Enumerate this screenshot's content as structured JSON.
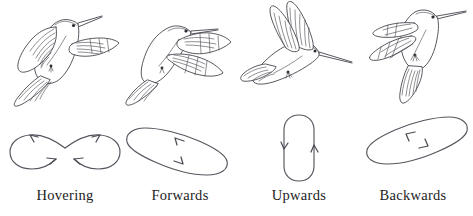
{
  "figure": {
    "background_color": "#ffffff",
    "line_color": "#3b3b44",
    "path_color": "#55555e",
    "label_color": "#1c1c1c"
  },
  "panels": [
    {
      "id": "hovering",
      "label": "Hovering",
      "bird_name": "hummingbird-hovering",
      "bird_pose": "body angled up-left, wings swept back, tail fanned down-left, bill pointing up-right",
      "path_name": "figure-eight-path",
      "path_shape": "figure-eight",
      "path_description": "Horizontal figure-eight wingtip stroke with two crossing lobes",
      "arrows": [
        {
          "name": "arrow-upper-left",
          "direction": "up-left"
        },
        {
          "name": "arrow-lower-left",
          "direction": "right"
        },
        {
          "name": "arrow-upper-right",
          "direction": "up-right"
        },
        {
          "name": "arrow-lower-right",
          "direction": "left"
        }
      ]
    },
    {
      "id": "forwards",
      "label": "Forwards",
      "bird_name": "hummingbird-forwards",
      "bird_pose": "body horizontal, wings extended outward to the right, tail fanned left",
      "path_name": "descending-stadium-path",
      "path_shape": "stadium-tilted-descending",
      "path_description": "Elongated rounded loop tilted downwards to the right",
      "arrows": [
        {
          "name": "arrow-top",
          "direction": "left"
        },
        {
          "name": "arrow-bottom",
          "direction": "right"
        }
      ]
    },
    {
      "id": "upwards",
      "label": "Upwards",
      "bird_name": "hummingbird-upwards",
      "bird_pose": "body horizontal, wings raised vertically overhead, tail fanned left",
      "path_name": "vertical-stadium-path",
      "path_shape": "stadium-vertical",
      "path_description": "Tall narrow rounded loop oriented vertically",
      "arrows": [
        {
          "name": "arrow-left",
          "direction": "down"
        },
        {
          "name": "arrow-right",
          "direction": "up"
        }
      ]
    },
    {
      "id": "backwards",
      "label": "Backwards",
      "bird_name": "hummingbird-backwards",
      "bird_pose": "body upright, wings swept forward-left, tail hanging down, bill pointing up-right",
      "path_name": "ascending-stadium-path",
      "path_shape": "stadium-tilted-ascending",
      "path_description": "Elongated rounded loop tilted upwards to the right",
      "arrows": [
        {
          "name": "arrow-top",
          "direction": "down-left"
        },
        {
          "name": "arrow-bottom",
          "direction": "up-right"
        }
      ]
    }
  ]
}
